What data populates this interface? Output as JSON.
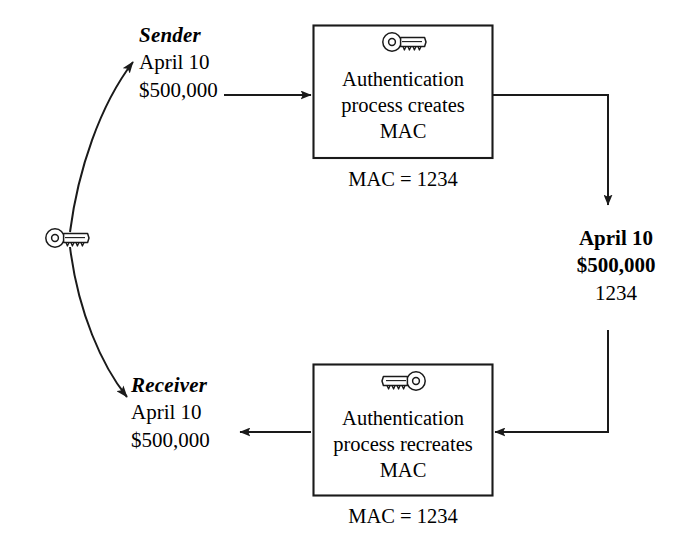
{
  "diagram": {
    "stroke_color": "#1a1a1a",
    "background_color": "#ffffff",
    "shared_key": {
      "icon": "key-icon",
      "label": ""
    },
    "sender": {
      "role_label": "Sender",
      "line1": "April 10",
      "line2": "$500,000"
    },
    "receiver": {
      "role_label": "Receiver",
      "line1": "April 10",
      "line2": "$500,000"
    },
    "transit_message": {
      "line1": "April 10",
      "line2": "$500,000",
      "line3": "1234"
    },
    "boxes": [
      {
        "id": "auth-create",
        "icon": "key-icon",
        "line1": "Authentication",
        "line2": "process creates",
        "line3": "MAC",
        "caption": "MAC = 1234"
      },
      {
        "id": "auth-recreate",
        "icon": "key-icon-mirrored",
        "line1": "Authentication",
        "line2": "process recreates",
        "line3": "MAC",
        "caption": "MAC = 1234"
      }
    ],
    "connectors": [
      {
        "id": "key-to-sender",
        "type": "curved-arrow"
      },
      {
        "id": "key-to-receiver",
        "type": "curved-arrow"
      },
      {
        "id": "sender-to-authbox",
        "type": "straight-arrow"
      },
      {
        "id": "authbox-to-transit",
        "type": "elbow-arrow"
      },
      {
        "id": "transit-to-authbox2",
        "type": "elbow-arrow"
      },
      {
        "id": "authbox2-to-receiver",
        "type": "straight-arrow"
      }
    ]
  }
}
